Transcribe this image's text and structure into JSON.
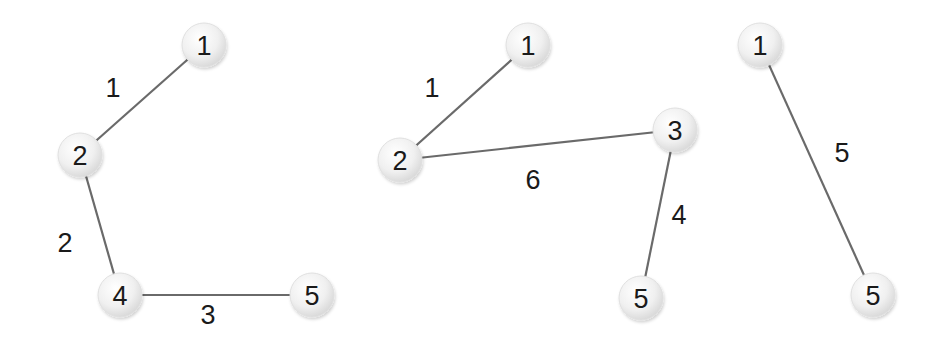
{
  "colors": {
    "background": "#ffffff",
    "edge": "#6a6a6a",
    "node_fill_center": "#ffffff",
    "node_fill_edge": "#dcdcdc",
    "text": "#1a1a1a"
  },
  "graphs": [
    {
      "name": "graph-1",
      "nodes": [
        {
          "id": "1",
          "label": "1",
          "x": 204,
          "y": 45
        },
        {
          "id": "2",
          "label": "2",
          "x": 80,
          "y": 155
        },
        {
          "id": "4",
          "label": "4",
          "x": 120,
          "y": 295
        },
        {
          "id": "5",
          "label": "5",
          "x": 312,
          "y": 295
        }
      ],
      "edges": [
        {
          "from": "1",
          "to": "2",
          "weight": "1",
          "label_x": 113,
          "label_y": 88
        },
        {
          "from": "2",
          "to": "4",
          "weight": "2",
          "label_x": 65,
          "label_y": 243
        },
        {
          "from": "4",
          "to": "5",
          "weight": "3",
          "label_x": 208,
          "label_y": 315
        }
      ]
    },
    {
      "name": "graph-2",
      "nodes": [
        {
          "id": "1",
          "label": "1",
          "x": 528,
          "y": 45
        },
        {
          "id": "2",
          "label": "2",
          "x": 400,
          "y": 160
        },
        {
          "id": "3",
          "label": "3",
          "x": 675,
          "y": 130
        },
        {
          "id": "5",
          "label": "5",
          "x": 641,
          "y": 298
        }
      ],
      "edges": [
        {
          "from": "1",
          "to": "2",
          "weight": "1",
          "label_x": 432,
          "label_y": 88
        },
        {
          "from": "2",
          "to": "3",
          "weight": "6",
          "label_x": 533,
          "label_y": 180
        },
        {
          "from": "3",
          "to": "5",
          "weight": "4",
          "label_x": 679,
          "label_y": 215
        }
      ]
    },
    {
      "name": "graph-3",
      "nodes": [
        {
          "id": "1",
          "label": "1",
          "x": 760,
          "y": 45
        },
        {
          "id": "5",
          "label": "5",
          "x": 873,
          "y": 295
        }
      ],
      "edges": [
        {
          "from": "1",
          "to": "5",
          "weight": "5",
          "label_x": 842,
          "label_y": 153
        }
      ]
    }
  ]
}
